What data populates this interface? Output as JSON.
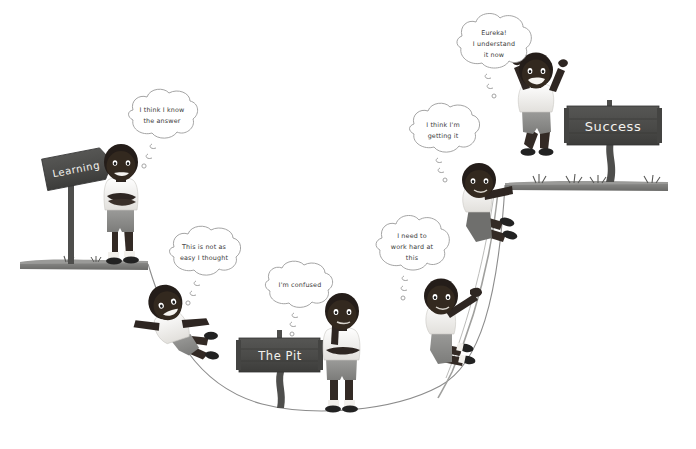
{
  "illustration": {
    "title": "The Learning Pit",
    "background_color": "#ffffff",
    "line_color": "#5a5a5a",
    "ground_color": "#6b6b6b",
    "sign_board_color": "#4a4a4a",
    "sign_text_color": "#f4f2ee",
    "skin_color": "#2e2622",
    "shirt_color": "#f2f0ec",
    "shorts_color": "#8e8e8e",
    "shoe_color": "#2b2b2b",
    "bubble_fill": "#ffffff",
    "bubble_stroke": "#9a9a9a",
    "handwriting_color": "#3a3a3a"
  },
  "signs": [
    {
      "id": "learning",
      "label": "Learning",
      "type": "arrow-signpost",
      "x": 22,
      "y": 148
    },
    {
      "id": "pit",
      "label": "The Pit",
      "type": "board-signpost",
      "x": 238,
      "y": 330
    },
    {
      "id": "success",
      "label": "Success",
      "type": "board-signpost",
      "x": 570,
      "y": 100
    }
  ],
  "thoughts": [
    {
      "id": "t1",
      "lines": [
        "I think I know",
        "the answer"
      ],
      "cx": 162,
      "cy": 124
    },
    {
      "id": "t2",
      "lines": [
        "This is not as",
        "easy I thought"
      ],
      "cx": 207,
      "cy": 258
    },
    {
      "id": "t3",
      "lines": [
        "I'm confused"
      ],
      "cx": 305,
      "cy": 283
    },
    {
      "id": "t4",
      "lines": [
        "I need to",
        "work hard at",
        "this"
      ],
      "cx": 414,
      "cy": 248
    },
    {
      "id": "t5",
      "lines": [
        "I think I'm",
        "getting it"
      ],
      "cx": 443,
      "cy": 135
    },
    {
      "id": "t6",
      "lines": [
        "Eureka!",
        "I understand",
        "it now"
      ],
      "cx": 494,
      "cy": 44
    }
  ],
  "characters": [
    {
      "id": "c1",
      "pose": "standing-arms-crossed",
      "stage": "confident",
      "x": 104,
      "y": 160
    },
    {
      "id": "c2",
      "pose": "falling",
      "stage": "struggling",
      "x": 140,
      "y": 295
    },
    {
      "id": "c3",
      "pose": "standing-hand-on-chin",
      "stage": "confused",
      "x": 318,
      "y": 305
    },
    {
      "id": "c4",
      "pose": "climbing-rope",
      "stage": "working",
      "x": 424,
      "y": 280
    },
    {
      "id": "c5",
      "pose": "pulling-onto-ledge",
      "stage": "progressing",
      "x": 452,
      "y": 168
    },
    {
      "id": "c6",
      "pose": "jumping-arms-up",
      "stage": "success",
      "x": 508,
      "y": 52
    }
  ],
  "terrain": {
    "left_ledge": {
      "x1": 22,
      "x2": 148,
      "y": 264
    },
    "right_ledge": {
      "x1": 505,
      "x2": 667,
      "y": 185
    },
    "pit_curve_label": "U-shaped pit curve from left ledge down to the bottom and up to right ledge",
    "rope_label": "rope hanging from right ledge into the pit"
  }
}
